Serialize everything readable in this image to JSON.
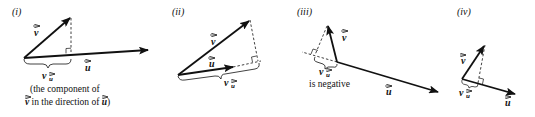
{
  "panels": [
    {
      "id": "i",
      "label": "(i)",
      "vector_v": "v",
      "vector_u": "u",
      "projection_label": "v",
      "projection_sub": "u",
      "caption_line1": "(the component of",
      "caption_line2_a": "v",
      "caption_line2_b": " in the direction of ",
      "caption_line2_c": "u",
      "caption_line2_d": ")"
    },
    {
      "id": "ii",
      "label": "(ii)",
      "vector_v": "v",
      "vector_u": "u",
      "projection_label": "v",
      "projection_sub": "u"
    },
    {
      "id": "iii",
      "label": "(iii)",
      "vector_v": "v",
      "vector_u": "u",
      "projection_label": "v",
      "projection_sub": "u",
      "caption": "is negative"
    },
    {
      "id": "iv",
      "label": "(iv)",
      "vector_v": "v",
      "vector_u": "u",
      "projection_label": "v",
      "projection_sub": "u"
    }
  ],
  "colors": {
    "ink": "#111111",
    "background": "#ffffff"
  }
}
